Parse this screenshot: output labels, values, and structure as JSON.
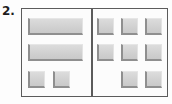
{
  "figure": {
    "item_number": "2.",
    "colors": {
      "frame_border": "#5b5b5b",
      "divider": "#5b5b5b",
      "tile_fill": "#d2d2d2",
      "tile_shadow": "#8f8f8f",
      "background": "#fcfcfc",
      "label_text": "#1d1d1d"
    }
  },
  "panels": [
    {
      "id": "left-panel",
      "name": "left-panel",
      "rows": [
        {
          "cells": [
            {
              "shape": "wide-bar",
              "present": true
            }
          ]
        },
        {
          "cells": [
            {
              "shape": "wide-bar",
              "present": true
            }
          ]
        },
        {
          "cells": [
            {
              "shape": "square",
              "present": true
            },
            {
              "shape": "square",
              "present": true
            },
            {
              "shape": "square",
              "present": false
            }
          ]
        }
      ]
    },
    {
      "id": "right-panel",
      "name": "right-panel",
      "rows": [
        {
          "cells": [
            {
              "shape": "square",
              "present": true
            },
            {
              "shape": "square",
              "present": true
            },
            {
              "shape": "square",
              "present": true
            }
          ]
        },
        {
          "cells": [
            {
              "shape": "square",
              "present": true
            },
            {
              "shape": "square",
              "present": true
            },
            {
              "shape": "square",
              "present": true
            }
          ]
        },
        {
          "cells": [
            {
              "shape": "square",
              "present": false
            },
            {
              "shape": "square",
              "present": true
            },
            {
              "shape": "square",
              "present": true
            }
          ]
        }
      ]
    }
  ]
}
